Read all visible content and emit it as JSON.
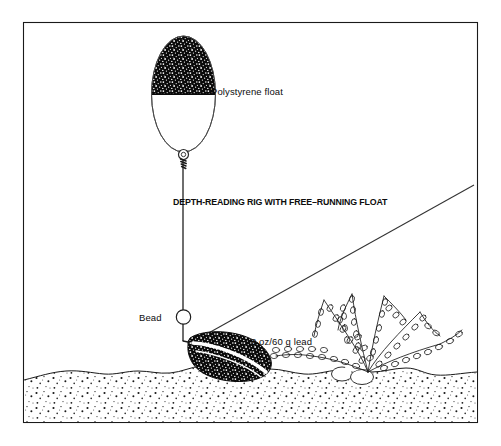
{
  "figure": {
    "title": "DEPTH-READING RIG WITH FREE–RUNNING FLOAT",
    "background_color": "#ffffff",
    "ink_color": "#0d0d0d",
    "border": {
      "name": "figure-frame",
      "color": "#1a1a1a"
    },
    "labels": {
      "float": "Polystyrene float",
      "bead": "Bead",
      "lead": "2 oz/60 g  lead"
    },
    "components": [
      {
        "id": "polystyrene-float",
        "label": "Polystyrene float",
        "shape": "ellipse",
        "top_half_fill": "stippled-black",
        "bottom_half_fill": "white"
      },
      {
        "id": "float-eyelet",
        "label": "",
        "shape": "small-ring"
      },
      {
        "id": "bead",
        "label": "Bead",
        "shape": "circle",
        "fill": "white"
      },
      {
        "id": "lead-weight",
        "label": "2 oz/60 g  lead",
        "shape": "teardrop",
        "fill": "stippled-black"
      },
      {
        "id": "mainline",
        "label": "",
        "shape": "diagonal-line"
      },
      {
        "id": "float-line",
        "label": "",
        "shape": "vertical-line"
      },
      {
        "id": "weed-plant",
        "label": "",
        "shape": "branching-weed"
      },
      {
        "id": "seabed",
        "label": "",
        "shape": "stippled-sediment"
      },
      {
        "id": "pebbles",
        "label": "",
        "shape": "oval-stones"
      }
    ]
  }
}
